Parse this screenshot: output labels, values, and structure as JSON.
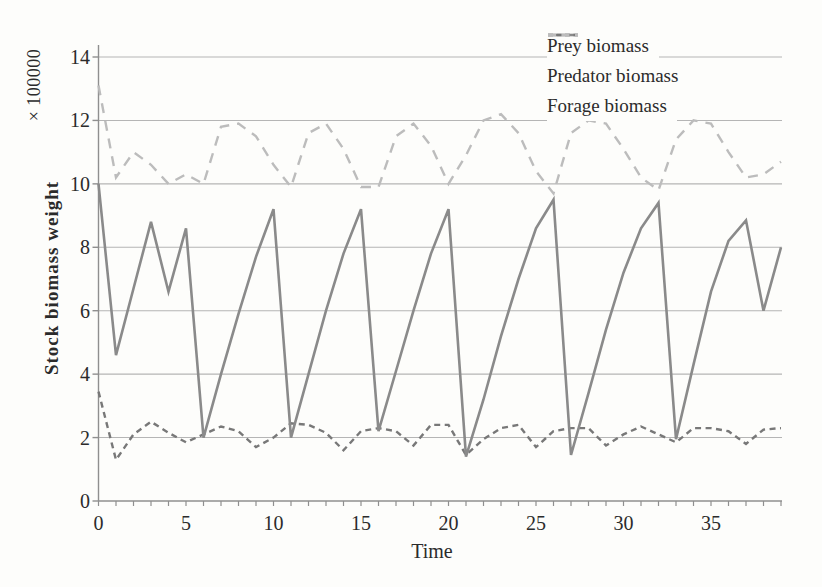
{
  "figure": {
    "background_color": "#fdfdfb",
    "text_color": "#2b2b2b",
    "gridline_color": "#b5b5b5",
    "axis_color": "#8f8f8f"
  },
  "chart_data": {
    "type": "line",
    "title": "",
    "xlabel": "Time",
    "ylabel": "Stock biomass weight",
    "y_axis_multiplier": "× 100000",
    "xlim": [
      0,
      39
    ],
    "ylim": [
      0,
      14
    ],
    "x_tick_labels": [
      0,
      5,
      10,
      15,
      20,
      25,
      30,
      35
    ],
    "x_minor_tick_step": 1,
    "y_ticks": [
      0,
      2,
      4,
      6,
      8,
      10,
      12,
      14
    ],
    "grid": "horizontal",
    "legend_position": "top-right",
    "x": [
      0,
      1,
      2,
      3,
      4,
      5,
      6,
      7,
      8,
      9,
      10,
      11,
      12,
      13,
      14,
      15,
      16,
      17,
      18,
      19,
      20,
      21,
      22,
      23,
      24,
      25,
      26,
      27,
      28,
      29,
      30,
      31,
      32,
      33,
      34,
      35,
      36,
      37,
      38,
      39
    ],
    "series": [
      {
        "name": "Prey biomass",
        "line_style": "solid",
        "color": "#8a8a8a",
        "values": [
          10.0,
          4.6,
          6.7,
          8.8,
          6.6,
          8.6,
          2.0,
          4.0,
          5.9,
          7.7,
          9.2,
          2.0,
          4.0,
          6.0,
          7.8,
          9.2,
          2.2,
          4.1,
          6.0,
          7.8,
          9.2,
          1.4,
          3.2,
          5.2,
          7.0,
          8.6,
          9.5,
          1.45,
          3.4,
          5.4,
          7.2,
          8.6,
          9.4,
          1.95,
          4.3,
          6.6,
          8.2,
          8.85,
          6.0,
          8.0
        ]
      },
      {
        "name": "Predator biomass",
        "line_style": "short-dash",
        "color": "#787878",
        "values": [
          3.45,
          1.3,
          2.1,
          2.5,
          2.15,
          1.85,
          2.1,
          2.35,
          2.2,
          1.7,
          2.0,
          2.45,
          2.4,
          2.15,
          1.6,
          2.2,
          2.3,
          2.2,
          1.75,
          2.4,
          2.4,
          1.45,
          1.95,
          2.3,
          2.4,
          1.7,
          2.2,
          2.3,
          2.3,
          1.75,
          2.1,
          2.35,
          2.1,
          1.85,
          2.3,
          2.3,
          2.2,
          1.8,
          2.25,
          2.3
        ]
      },
      {
        "name": "Forage biomass",
        "line_style": "long-dash",
        "color": "#bcbcbc",
        "values": [
          13.1,
          10.2,
          11.0,
          10.6,
          10.0,
          10.3,
          10.0,
          11.8,
          11.9,
          11.5,
          10.6,
          9.9,
          11.6,
          11.9,
          11.1,
          9.9,
          9.9,
          11.5,
          11.9,
          11.2,
          10.0,
          10.9,
          12.0,
          12.2,
          11.6,
          10.4,
          9.7,
          11.6,
          12.0,
          11.9,
          11.1,
          10.2,
          9.8,
          11.4,
          12.0,
          11.9,
          11.0,
          10.2,
          10.3,
          10.7
        ]
      }
    ]
  }
}
